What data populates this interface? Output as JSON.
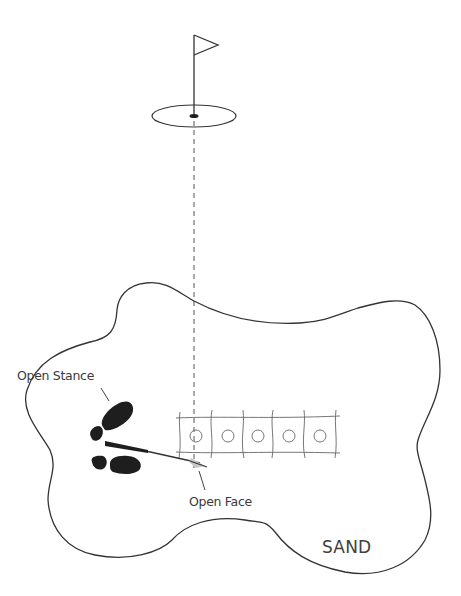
{
  "diagram": {
    "labels": {
      "open_stance": "Open Stance",
      "open_face": "Open Face",
      "sand": "SAND"
    },
    "elements": {
      "flag": "flag-icon",
      "green": "putting-green",
      "hole": "hole-cup",
      "target_line": "dashed-aim-line",
      "bunker": "sand-bunker-outline",
      "footprints": [
        "left-shoe-print",
        "right-shoe-print"
      ],
      "club": "golf-club-wedge",
      "strike_zone": {
        "cells": 5,
        "markers": [
          "ball-marker-1",
          "ball-marker-2",
          "ball-marker-3",
          "ball-marker-4",
          "ball-marker-5"
        ]
      }
    },
    "colors": {
      "line": "#333333",
      "text": "#3a3a3a",
      "shoe": "#1e1e1e",
      "clubhead": "#c8c8c8",
      "background": "#ffffff"
    }
  }
}
